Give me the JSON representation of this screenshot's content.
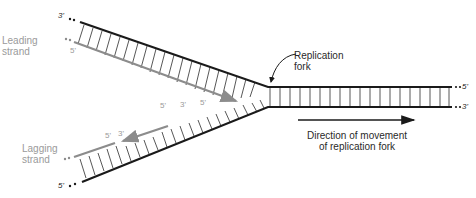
{
  "diagram": {
    "labels": {
      "leading_strand": [
        "Leading",
        "strand"
      ],
      "lagging_strand": [
        "Lagging",
        "strand"
      ],
      "replication_fork": [
        "Replication",
        "fork"
      ],
      "direction": [
        "Direction of movement",
        "of replication fork"
      ]
    },
    "ends": {
      "top_parent_left": "3'",
      "leading_left": "5'",
      "duplex_top_right": "5'",
      "duplex_bottom_right": "3'",
      "bottom_parent_left": "5'",
      "lagging_frag1_5": "5'",
      "lagging_frag1_3": "3'",
      "lagging_frag2_5": "5'",
      "leading_tip_5": "5'",
      "fragment_mid_3": "3'"
    },
    "colors": {
      "parental_strand": "#1a1a1a",
      "new_strand": "#8c8c8c",
      "rungs": "#444444",
      "label_gray": "#9a9a9a",
      "label_dark": "#2a2a2a"
    }
  }
}
